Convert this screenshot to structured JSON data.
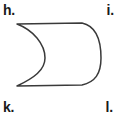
{
  "figure": {
    "shape_name": "crescent-lune",
    "stroke_color": "#3a3a3a",
    "fill_color": "#ffffff",
    "background_color": "#ffffff",
    "stroke_width": 1.5,
    "outline_path": "M 17 24 L 82 23 C 96 26 101 40 101 58 C 101 74 95 82 82 85 L 17 86 C 34 78 45 70 45 58 C 45 44 33 30 17 24 Z",
    "geometry": {
      "top_edge_start": [
        17,
        24
      ],
      "top_edge_end": [
        82,
        23
      ],
      "right_arc_extreme_x": 101,
      "right_arc_extreme_y": 58,
      "bottom_edge_start": [
        82,
        85
      ],
      "bottom_edge_end": [
        17,
        86
      ],
      "left_concave_extreme_x": 45,
      "left_concave_extreme_y": 58
    }
  },
  "labels": {
    "top_left": "h.",
    "top_right": "i.",
    "bottom_left": "k.",
    "bottom_right": "l."
  },
  "canvas": {
    "width": 118,
    "height": 117
  }
}
